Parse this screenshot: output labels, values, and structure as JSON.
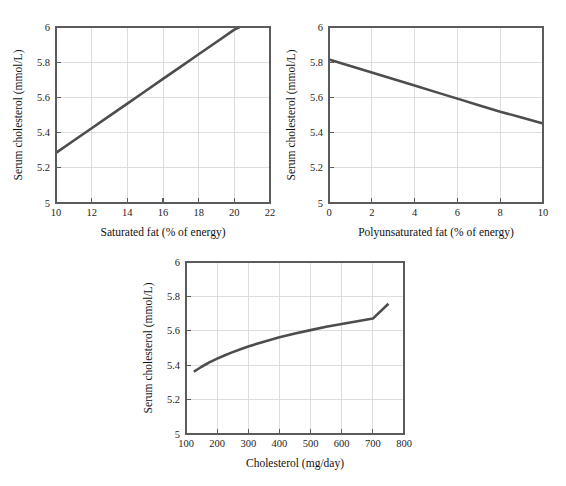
{
  "figure": {
    "background_color": "#ffffff",
    "line_color": "#4d4d4d",
    "grid_color": "#d9d9d9",
    "axis_color": "#5b5b5b"
  },
  "chart_data": [
    {
      "type": "line",
      "id": "saturated-fat",
      "title": "",
      "xlabel": "Saturated fat (% of energy)",
      "ylabel": "Serum cholesterol (mmol/L)",
      "xlim": [
        10,
        22
      ],
      "ylim": [
        5,
        6
      ],
      "xticks": [
        10,
        12,
        14,
        16,
        18,
        20,
        22
      ],
      "xtick_labels": [
        "10",
        "12",
        "14",
        "16",
        "18",
        "20",
        "22"
      ],
      "yticks": [
        5,
        5.2,
        5.4,
        5.6,
        5.8,
        6
      ],
      "ytick_labels": [
        "5",
        "5.2",
        "5.4",
        "5.6",
        "5.8",
        "6"
      ],
      "grid": true,
      "legend": "none",
      "series": [
        {
          "name": "Serum cholesterol vs saturated fat",
          "x": [
            10,
            11,
            12,
            13,
            14,
            15,
            16,
            17,
            18,
            19,
            20,
            20.3
          ],
          "y": [
            5.285,
            5.355,
            5.425,
            5.495,
            5.565,
            5.635,
            5.705,
            5.775,
            5.845,
            5.915,
            5.985,
            6.0
          ]
        }
      ]
    },
    {
      "type": "line",
      "id": "polyunsaturated-fat",
      "title": "",
      "xlabel": "Polyunsaturated fat (% of energy)",
      "ylabel": "Serum cholesterol (mmol/L)",
      "xlim": [
        0,
        10
      ],
      "ylim": [
        5,
        6
      ],
      "xticks": [
        0,
        2,
        4,
        6,
        8,
        10
      ],
      "xtick_labels": [
        "0",
        "2",
        "4",
        "6",
        "8",
        "10"
      ],
      "yticks": [
        5,
        5.2,
        5.4,
        5.6,
        5.8,
        6
      ],
      "ytick_labels": [
        "5",
        "5.2",
        "5.4",
        "5.6",
        "5.8",
        "6"
      ],
      "grid": true,
      "legend": "none",
      "series": [
        {
          "name": "Serum cholesterol vs polyunsaturated fat",
          "x": [
            0,
            1,
            2,
            3,
            4,
            5,
            6,
            7,
            8,
            9,
            10
          ],
          "y": [
            5.815,
            5.778,
            5.741,
            5.704,
            5.667,
            5.63,
            5.593,
            5.556,
            5.519,
            5.486,
            5.452
          ]
        }
      ]
    },
    {
      "type": "line",
      "id": "dietary-cholesterol",
      "title": "",
      "xlabel": "Cholesterol (mg/day)",
      "ylabel": "Serum cholesterol (mmol/L)",
      "xlim": [
        100,
        800
      ],
      "ylim": [
        5,
        6
      ],
      "xticks": [
        100,
        200,
        300,
        400,
        500,
        600,
        700,
        800
      ],
      "xtick_labels": [
        "100",
        "200",
        "300",
        "400",
        "500",
        "600",
        "700",
        "800"
      ],
      "yticks": [
        5,
        5.2,
        5.4,
        5.6,
        5.8,
        6
      ],
      "ytick_labels": [
        "5",
        "5.2",
        "5.4",
        "5.6",
        "5.8",
        "6"
      ],
      "grid": true,
      "legend": "none",
      "series": [
        {
          "name": "Serum cholesterol vs dietary cholesterol",
          "x": [
            125,
            150,
            175,
            200,
            225,
            250,
            275,
            300,
            350,
            400,
            450,
            500,
            550,
            600,
            650,
            700,
            750
          ],
          "y": [
            5.362,
            5.391,
            5.416,
            5.438,
            5.458,
            5.476,
            5.493,
            5.509,
            5.537,
            5.562,
            5.584,
            5.604,
            5.623,
            5.64,
            5.656,
            5.671,
            5.757
          ]
        }
      ]
    }
  ]
}
